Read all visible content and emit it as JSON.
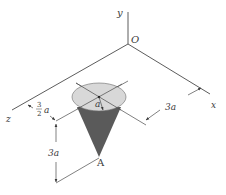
{
  "figure": {
    "type": "3d-statics-diagram",
    "axes": {
      "y_label": "y",
      "x_label": "x",
      "z_label": "z",
      "origin_label": "O"
    },
    "cone": {
      "radius_label": "a",
      "apex_label": "A",
      "base_fill": "#d8d8d8",
      "body_fill": "#5a5a5a"
    },
    "dimensions": {
      "x_offset": "3a",
      "z_offset_num": "3",
      "z_offset_den": "2",
      "z_offset_var": "a",
      "height": "3a"
    }
  },
  "colors": {
    "line": "#4a4a4a",
    "text": "#3a3a3a",
    "background": "#ffffff"
  }
}
